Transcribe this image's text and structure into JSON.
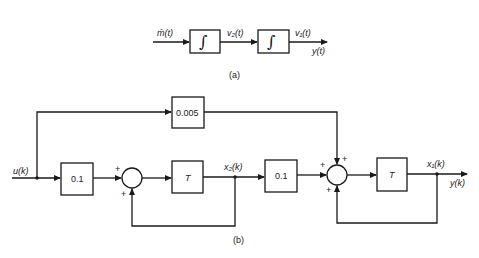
{
  "diagram_a": {
    "caption": "(a)",
    "input_label": "m̄(t)",
    "blocks": [
      {
        "id": "int1",
        "symbol": "∫"
      },
      {
        "id": "int2",
        "symbol": "∫"
      }
    ],
    "intermediate_label": "v₂(t)",
    "output_labels": [
      "v₁(t)",
      "y(t)"
    ]
  },
  "diagram_b": {
    "caption": "(b)",
    "input_label": "u(k)",
    "blocks": [
      {
        "id": "gain_feedforward",
        "label": "0.005"
      },
      {
        "id": "gain_in",
        "label": "0.1"
      },
      {
        "id": "delay1",
        "label": "T"
      },
      {
        "id": "gain_mid",
        "label": "0.1"
      },
      {
        "id": "delay2",
        "label": "T"
      }
    ],
    "summers": [
      {
        "id": "sum1",
        "signs": [
          "+",
          "+"
        ]
      },
      {
        "id": "sum2",
        "signs": [
          "+",
          "+",
          "+"
        ]
      }
    ],
    "state_labels": [
      "x₂(k)",
      "x₁(k)"
    ],
    "output_label": "y(k)"
  }
}
